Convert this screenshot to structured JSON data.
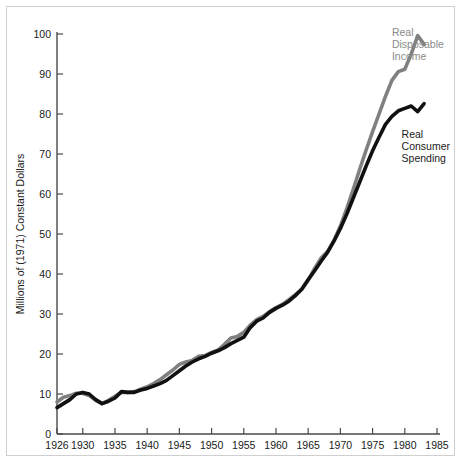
{
  "chart_data": {
    "type": "line",
    "title": "",
    "subtitle": "",
    "xlabel": "",
    "ylabel": "Millions of (1971) Constant Dollars",
    "xlim": [
      1926,
      1985
    ],
    "ylim": [
      0,
      100
    ],
    "grid": false,
    "legend_position": "inline-annotations",
    "xticks": [
      1926,
      1930,
      1935,
      1940,
      1945,
      1950,
      1955,
      1960,
      1965,
      1970,
      1975,
      1980,
      1985
    ],
    "xtick_labels": [
      "1926",
      "1930",
      "1935",
      "1940",
      "1945",
      "1950",
      "1955",
      "1960",
      "1965",
      "1970",
      "1975",
      "1980",
      "1985"
    ],
    "yticks": [
      0,
      10,
      20,
      30,
      40,
      50,
      60,
      70,
      80,
      90,
      100
    ],
    "ytick_labels": [
      "0",
      "10",
      "20",
      "30",
      "40",
      "50",
      "60",
      "70",
      "80",
      "90",
      "100"
    ],
    "annotations": [
      {
        "name": "real-disposable-income-label",
        "text": "Real\nDisposable\nIncome",
        "lines": [
          "Real",
          "Disposable",
          "Income"
        ],
        "color": "#8a8a8a",
        "x": 1978.0,
        "y": 99.5
      },
      {
        "name": "real-consumer-spending-label",
        "text": "Real\nConsumer\nSpending",
        "lines": [
          "Real",
          "Consumer",
          "Spending"
        ],
        "color": "#1a1a1a",
        "x": 1979.5,
        "y": 74.0
      }
    ],
    "series": [
      {
        "name": "Real Disposable Income",
        "color": "#808080",
        "x": [
          1926,
          1927,
          1928,
          1929,
          1930,
          1931,
          1932,
          1933,
          1934,
          1935,
          1936,
          1937,
          1938,
          1939,
          1940,
          1941,
          1942,
          1943,
          1944,
          1945,
          1946,
          1947,
          1948,
          1949,
          1950,
          1951,
          1952,
          1953,
          1954,
          1955,
          1956,
          1957,
          1958,
          1959,
          1960,
          1961,
          1962,
          1963,
          1964,
          1965,
          1966,
          1967,
          1968,
          1969,
          1970,
          1971,
          1972,
          1973,
          1974,
          1975,
          1976,
          1977,
          1978,
          1979,
          1980,
          1981,
          1982,
          1983
        ],
        "values": [
          8.0,
          9.2,
          9.6,
          10.2,
          10.2,
          9.6,
          8.4,
          7.6,
          8.4,
          9.4,
          10.4,
          10.4,
          10.6,
          11.2,
          11.8,
          12.6,
          13.6,
          14.8,
          16.0,
          17.4,
          18.0,
          18.4,
          19.4,
          19.6,
          20.4,
          21.0,
          22.4,
          24.0,
          24.4,
          25.4,
          27.2,
          28.6,
          29.4,
          30.6,
          31.6,
          32.4,
          33.6,
          34.8,
          36.2,
          38.4,
          41.4,
          44.0,
          45.6,
          48.4,
          52.0,
          56.4,
          61.2,
          66.2,
          71.0,
          75.6,
          80.0,
          84.4,
          88.4,
          90.6,
          91.2,
          95.0,
          99.6,
          97.4
        ]
      },
      {
        "name": "Real Consumer Spending",
        "color": "#111111",
        "x": [
          1926,
          1927,
          1928,
          1929,
          1930,
          1931,
          1932,
          1933,
          1934,
          1935,
          1936,
          1937,
          1938,
          1939,
          1940,
          1941,
          1942,
          1943,
          1944,
          1945,
          1946,
          1947,
          1948,
          1949,
          1950,
          1951,
          1952,
          1953,
          1954,
          1955,
          1956,
          1957,
          1958,
          1959,
          1960,
          1961,
          1962,
          1963,
          1964,
          1965,
          1966,
          1967,
          1968,
          1969,
          1970,
          1971,
          1972,
          1973,
          1974,
          1975,
          1976,
          1977,
          1978,
          1979,
          1980,
          1981,
          1982,
          1983
        ],
        "values": [
          6.6,
          7.6,
          8.6,
          10.0,
          10.4,
          10.0,
          8.6,
          7.6,
          8.2,
          9.0,
          10.6,
          10.4,
          10.4,
          11.0,
          11.4,
          12.0,
          12.6,
          13.4,
          14.6,
          15.8,
          17.0,
          18.0,
          18.8,
          19.4,
          20.2,
          20.8,
          21.6,
          22.6,
          23.4,
          24.2,
          26.6,
          28.2,
          29.0,
          30.4,
          31.4,
          32.2,
          33.2,
          34.6,
          36.2,
          38.6,
          40.8,
          43.2,
          45.4,
          48.2,
          51.4,
          55.0,
          59.0,
          63.0,
          67.0,
          70.8,
          74.2,
          77.4,
          79.4,
          80.8,
          81.4,
          82.0,
          80.6,
          82.6
        ]
      }
    ]
  },
  "geometry": {
    "plot_left": 57,
    "plot_right": 437,
    "plot_top": 34,
    "plot_bottom": 434,
    "x_min": 1926,
    "x_max": 1985,
    "y_min": 0,
    "y_max": 100
  }
}
